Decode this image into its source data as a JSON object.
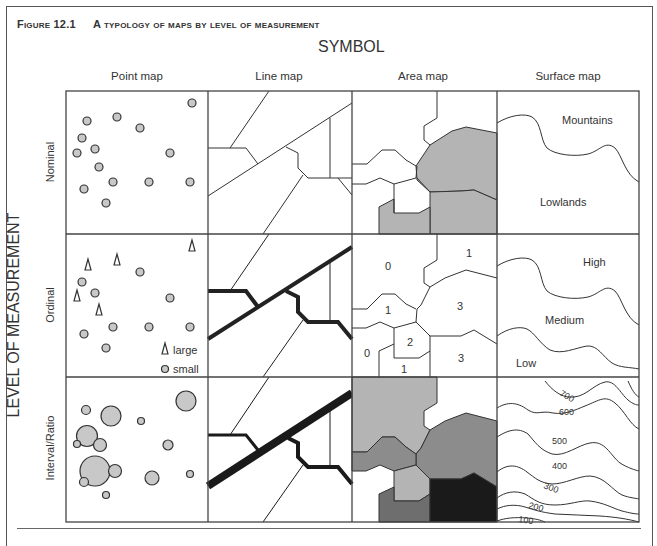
{
  "figure": {
    "number": "Figure 12.1",
    "title": "A typology of maps by level of measurement"
  },
  "axes": {
    "column_axis_title": "SYMBOL",
    "row_axis_title": "LEVEL OF MEASUREMENT",
    "columns": [
      "Point map",
      "Line map",
      "Area map",
      "Surface map"
    ],
    "rows": [
      "Nominal",
      "Ordinal",
      "Interval/Ratio"
    ]
  },
  "cells": {
    "point_ordinal_legend": {
      "large": "large",
      "small": "small"
    },
    "area_ordinal_labels": [
      "0",
      "1",
      "1",
      "3",
      "2",
      "0",
      "1",
      "3"
    ],
    "surface_nominal_labels": {
      "upper": "Mountains",
      "lower": "Lowlands"
    },
    "surface_ordinal_labels": {
      "high": "High",
      "medium": "Medium",
      "low": "Low"
    },
    "surface_interval_contours": [
      "700",
      "600",
      "500",
      "400",
      "300",
      "200",
      "100"
    ]
  },
  "colors": {
    "line": "#333333",
    "symbol_fill": "#c8c8c8",
    "area_light": "#b4b4b4",
    "area_mid": "#8c8c8c",
    "area_dark": "#6e6e6e",
    "area_black": "#1a1a1a"
  }
}
